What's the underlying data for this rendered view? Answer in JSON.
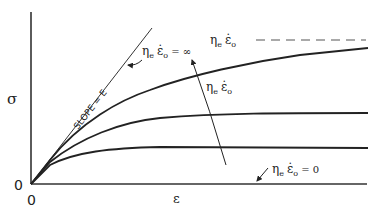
{
  "figure": {
    "type": "stress-strain schematic",
    "colors": {
      "ink": "#222222",
      "background": "#ffffff"
    }
  },
  "axes": {
    "y_label": "σ",
    "x_label": "ε",
    "y_origin_label": "0",
    "x_origin_label": "0"
  },
  "annotations": {
    "slope_label": "SLOPE = E",
    "limit_infinite": {
      "eta": "η",
      "eta_sub": "e",
      "eps": "ε̇",
      "eps_sub": "o",
      "rel": " = ∞"
    },
    "asymptote": {
      "eta": "η",
      "eta_sub": "e",
      "eps": "ε̇",
      "eps_sub": "o"
    },
    "increasing_rate": {
      "eta": "η",
      "eta_sub": "e",
      "eps": "ε̇",
      "eps_sub": "o"
    },
    "limit_zero": {
      "eta": "η",
      "eta_sub": "e",
      "eps": "ε̇",
      "eps_sub": "o",
      "rel": " = 0"
    }
  },
  "curves": [
    {
      "name": "elastic-limit",
      "description": "initial linear slope E (η_e ε̇_o = ∞)"
    },
    {
      "name": "high-rate",
      "relative_plateau": 0.95
    },
    {
      "name": "medium-rate",
      "relative_plateau": 0.49
    },
    {
      "name": "low-rate",
      "relative_plateau": 0.25
    },
    {
      "name": "zero-rate",
      "relative_plateau": 0.0,
      "description": "coincides with strain axis (η_e ε̇_o = 0)"
    }
  ]
}
